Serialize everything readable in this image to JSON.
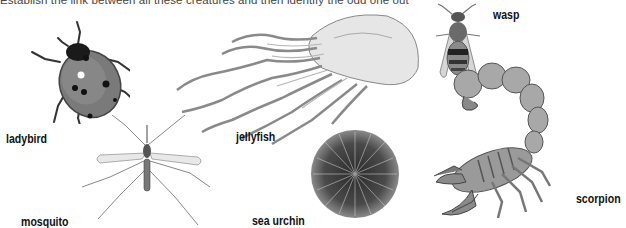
{
  "instruction": "Establish the link between all these creatures and then identify the odd one out",
  "creatures": [
    {
      "id": "ladybird",
      "label": "ladybird"
    },
    {
      "id": "mosquito",
      "label": "mosquito"
    },
    {
      "id": "jellyfish",
      "label": "jellyfish"
    },
    {
      "id": "sea-urchin",
      "label": "sea urchin"
    },
    {
      "id": "wasp",
      "label": "wasp"
    },
    {
      "id": "scorpion",
      "label": "scorpion"
    }
  ]
}
